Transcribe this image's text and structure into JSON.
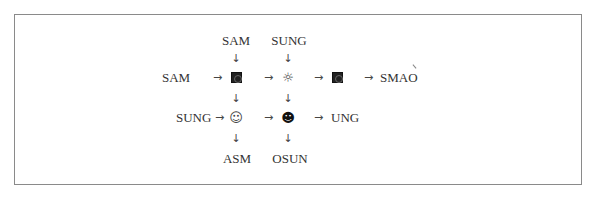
{
  "diagram": {
    "top_labels": [
      "SAM",
      "SUNG"
    ],
    "row1": {
      "input_label": "SAM",
      "node1_symbol": "black-square-circle",
      "node2_symbol": "sun",
      "node3_symbol": "black-square-circle",
      "output_label": "SMAO"
    },
    "row2": {
      "input_label": "SUNG",
      "node1_symbol": "white-smiley",
      "node2_symbol": "black-smiley",
      "output_label": "UNG"
    },
    "bottom_labels": [
      "ASM",
      "OSUN"
    ],
    "glyphs": {
      "arrow_right": "→",
      "arrow_down": "↓",
      "sun": "☼",
      "white_smiley": "☺",
      "black_smiley": "☻"
    }
  }
}
